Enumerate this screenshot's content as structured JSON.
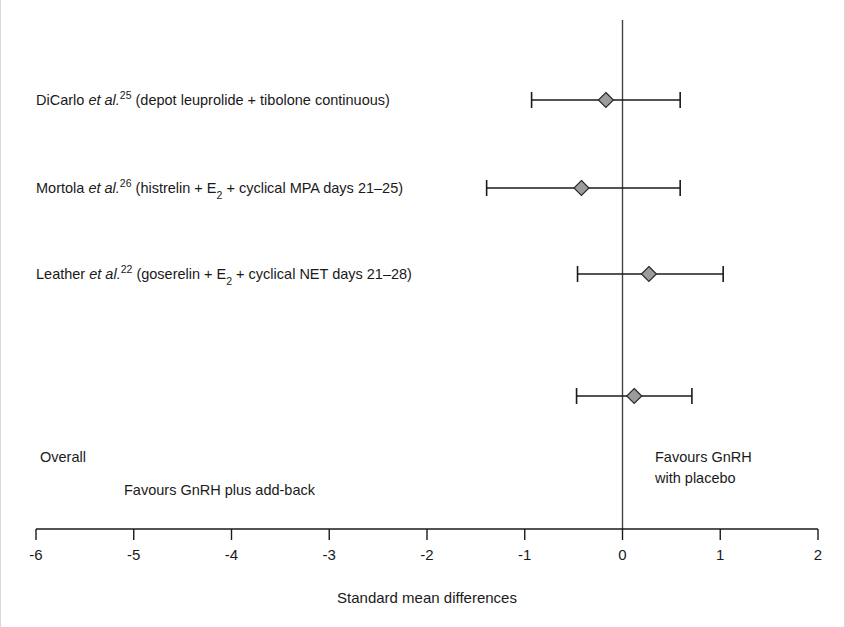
{
  "chart_data": {
    "type": "scatter",
    "plot_kind": "forest-plot",
    "title": "",
    "xlabel": "Standard mean differences",
    "ylabel": "",
    "xlim": [
      -6,
      2
    ],
    "x_ticks": [
      -6,
      -5,
      -4,
      -3,
      -2,
      -1,
      0,
      1,
      2
    ],
    "x_tick_labels": [
      "-6",
      "-5",
      "-4",
      "-3",
      "-2",
      "-1",
      "0",
      "1",
      "2"
    ],
    "grid": false,
    "legend": "none",
    "reference_line": 0,
    "marker_shape": "diamond",
    "marker_fill": "#9c9c9c",
    "marker_edge": "#2b2b2b",
    "rows": [
      {
        "label_parts": {
          "author": "DiCarlo",
          "etal": "et al.",
          "ref": "25",
          "detail": "(depot leuprolide + tibolone continuous)"
        },
        "estimate": -0.17,
        "ci_low": -0.93,
        "ci_high": 0.59
      },
      {
        "label_parts": {
          "author": "Mortola",
          "etal": "et al.",
          "ref": "26",
          "detail_a": "(histrelin + E",
          "sub": "2",
          "detail_b": " + cyclical MPA days 21–25)"
        },
        "estimate": -0.42,
        "ci_low": -1.39,
        "ci_high": 0.59
      },
      {
        "label_parts": {
          "author": "Leather",
          "etal": "et al.",
          "ref": "22",
          "detail_a": "(goserelin + E",
          "sub": "2",
          "detail_b": " + cyclical NET days 21–28)"
        },
        "estimate": 0.27,
        "ci_low": -0.46,
        "ci_high": 1.03
      },
      {
        "label_parts": {
          "author": "Overall",
          "etal": "",
          "ref": "",
          "detail": ""
        },
        "estimate": 0.12,
        "ci_low": -0.47,
        "ci_high": 0.71,
        "is_summary": true
      }
    ],
    "annotations": {
      "left_favours": "Favours GnRH plus add-back",
      "right_favours_line1": "Favours GnRH",
      "right_favours_line2": "with placebo",
      "overall_label": "Overall"
    }
  },
  "colors": {
    "background": "#ffffff",
    "ink": "#1a1a1a",
    "marker_fill": "#9c9c9c",
    "marker_edge": "#2b2b2b",
    "zero_line": "#444444"
  }
}
